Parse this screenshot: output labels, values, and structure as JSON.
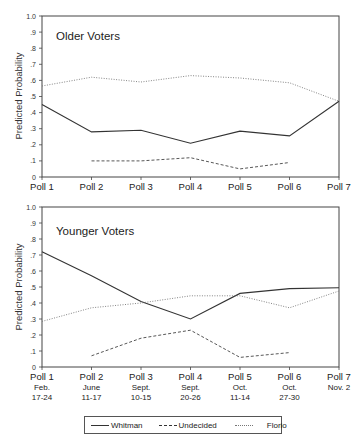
{
  "chart_data": [
    {
      "type": "line",
      "title": "Older Voters",
      "xlabel": "",
      "ylabel": "Predicted Probability",
      "ylim": [
        0,
        1.0
      ],
      "yticks": [
        "0",
        ".1",
        ".2",
        ".3",
        ".4",
        ".5",
        ".6",
        ".7",
        ".8",
        ".9",
        "1.0"
      ],
      "categories": [
        "Poll 1",
        "Poll 2",
        "Poll 3",
        "Poll 4",
        "Poll 5",
        "Poll 6",
        "Poll 7"
      ],
      "category_sublabels": [],
      "grid": false,
      "series": [
        {
          "name": "Whitman",
          "style": "solid",
          "values": [
            0.45,
            0.28,
            0.29,
            0.21,
            0.285,
            0.255,
            0.47
          ]
        },
        {
          "name": "Undecided",
          "style": "dashed",
          "values": [
            null,
            0.1,
            0.1,
            0.12,
            0.05,
            0.09,
            null
          ]
        },
        {
          "name": "Florio",
          "style": "dotted",
          "values": [
            0.565,
            0.62,
            0.59,
            0.63,
            0.615,
            0.585,
            0.47
          ]
        }
      ]
    },
    {
      "type": "line",
      "title": "Younger Voters",
      "xlabel": "",
      "ylabel": "Predicted Probability",
      "ylim": [
        0,
        1.0
      ],
      "yticks": [
        "0",
        ".1",
        ".2",
        ".3",
        ".4",
        ".5",
        ".6",
        ".7",
        ".8",
        ".9",
        "1.0"
      ],
      "categories": [
        "Poll 1",
        "Poll 2",
        "Poll 3",
        "Poll 4",
        "Poll 5",
        "Poll 6",
        "Poll 7"
      ],
      "category_sublabels": [
        [
          "Feb.",
          "17-24"
        ],
        [
          "June",
          "11-17"
        ],
        [
          "Sept.",
          "10-15"
        ],
        [
          "Sept.",
          "20-26"
        ],
        [
          "Oct.",
          "11-14"
        ],
        [
          "Oct.",
          "27-30"
        ],
        [
          "Nov. 2"
        ]
      ],
      "grid": false,
      "series": [
        {
          "name": "Whitman",
          "style": "solid",
          "values": [
            0.72,
            0.57,
            0.41,
            0.3,
            0.46,
            0.49,
            0.495
          ]
        },
        {
          "name": "Undecided",
          "style": "dashed",
          "values": [
            null,
            0.07,
            0.18,
            0.23,
            0.06,
            0.09,
            null
          ]
        },
        {
          "name": "Florio",
          "style": "dotted",
          "values": [
            0.285,
            0.37,
            0.4,
            0.445,
            0.445,
            0.37,
            0.475
          ]
        }
      ]
    }
  ],
  "legend": {
    "position": "bottom",
    "items": [
      {
        "label": "Whitman",
        "style": "solid"
      },
      {
        "label": "Undecided",
        "style": "dashed"
      },
      {
        "label": "Florio",
        "style": "dotted"
      }
    ]
  },
  "colors": {
    "line": "#333333",
    "axis": "#444444",
    "background": "#ffffff"
  }
}
